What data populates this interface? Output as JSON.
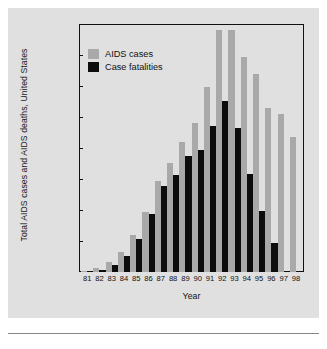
{
  "chart_data": {
    "type": "bar",
    "title": "",
    "xlabel": "Year",
    "ylabel": "Total AIDS cases and AIDS deaths, United States",
    "ylim": [
      0,
      80000
    ],
    "ytick_labels": [
      "80,000",
      "70,000",
      "60,000",
      "50,000",
      "40,000",
      "30,000",
      "20,000",
      "10,000"
    ],
    "ytick_values": [
      80000,
      70000,
      60000,
      50000,
      40000,
      30000,
      20000,
      10000
    ],
    "grid": false,
    "legend_position": "top-left-inside",
    "categories": [
      "81",
      "82",
      "83",
      "84",
      "85",
      "86",
      "87",
      "88",
      "89",
      "90",
      "91",
      "92",
      "93",
      "94",
      "95",
      "96",
      "97",
      "98"
    ],
    "series": [
      {
        "name": "AIDS cases",
        "color": "#a9a9a9",
        "values": [
          300,
          1200,
          3100,
          6400,
          11800,
          19200,
          29500,
          35200,
          42000,
          48000,
          59800,
          78000,
          78000,
          69500,
          64000,
          53000,
          51000,
          43500
        ]
      },
      {
        "name": "Case fatalities",
        "color": "#0d0d0d",
        "values": [
          200,
          800,
          2200,
          5300,
          10700,
          18700,
          27700,
          31200,
          37400,
          39500,
          47000,
          55300,
          46300,
          31600,
          19800,
          9500,
          0,
          0
        ]
      }
    ]
  },
  "legend": {
    "items": [
      {
        "label": "AIDS cases",
        "swatch": "cases"
      },
      {
        "label": "Case fatalities",
        "swatch": "deaths"
      }
    ]
  },
  "axis": {
    "x_title": "Year",
    "y_title": "Total AIDS cases and AIDS deaths, United States"
  }
}
